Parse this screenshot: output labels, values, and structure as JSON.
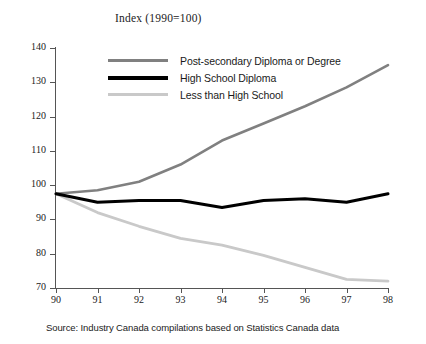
{
  "title": "Index (1990=100)",
  "source_note": "Source: Industry Canada compilations based on Statistics Canada data",
  "legend": {
    "items": [
      {
        "label": "Post-secondary Diploma or Degree",
        "color": "#808080"
      },
      {
        "label": "High School Diploma",
        "color": "#000000"
      },
      {
        "label": "Less than High School",
        "color": "#c9c9c9"
      }
    ]
  },
  "axes": {
    "y_ticks": [
      "70",
      "80",
      "90",
      "100",
      "110",
      "120",
      "130",
      "140"
    ],
    "x_ticks": [
      "90",
      "91",
      "92",
      "93",
      "94",
      "95",
      "96",
      "97",
      "98"
    ]
  },
  "chart_data": {
    "type": "line",
    "title": "Index (1990=100)",
    "xlabel": "",
    "ylabel": "Index (1990=100)",
    "x": [
      1990,
      1991,
      1992,
      1993,
      1994,
      1995,
      1996,
      1997,
      1998
    ],
    "x_tick_labels": [
      "90",
      "91",
      "92",
      "93",
      "94",
      "95",
      "96",
      "97",
      "98"
    ],
    "xlim": [
      1990,
      1998
    ],
    "ylim": [
      70,
      140
    ],
    "y_ticks": [
      70,
      80,
      90,
      100,
      110,
      120,
      130,
      140
    ],
    "grid": false,
    "legend_position": "upper-left-inside",
    "series": [
      {
        "name": "Post-secondary Diploma or Degree",
        "color": "#808080",
        "values": [
          97.5,
          98.5,
          101.0,
          106.0,
          113.0,
          118.0,
          123.0,
          128.5,
          135.0
        ]
      },
      {
        "name": "High School Diploma",
        "color": "#000000",
        "values": [
          97.5,
          95.0,
          95.5,
          95.5,
          93.5,
          95.5,
          96.0,
          95.0,
          97.5
        ]
      },
      {
        "name": "Less than High School",
        "color": "#c9c9c9",
        "values": [
          97.5,
          92.0,
          88.0,
          84.5,
          82.5,
          79.5,
          76.0,
          72.5,
          72.0
        ]
      }
    ]
  }
}
